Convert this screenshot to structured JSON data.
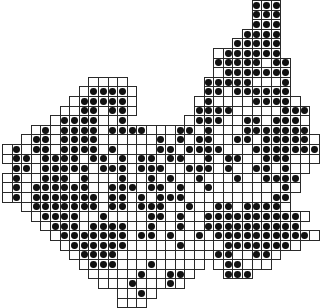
{
  "map": {
    "type": "grid distribution map",
    "cell_size_px": 9.6,
    "origin": [
      2,
      0
    ],
    "colors": {
      "grid": "#2a2a2a",
      "dot": "#111111",
      "background": "#ffffff"
    },
    "legend": {
      "o": "surveyed square, species absent",
      "#": "surveyed square, species recorded",
      ".": "outside region"
    },
    "rows": [
      "..........................###....",
      "..........................###....",
      "..........................###....",
      ".........................####....",
      "........................#####....",
      "......................o######....",
      "......................#####o##...",
      "......................o#######...",
      ".........oooo........#####ooo#...",
      "........o####o.......##o######...",
      ".......o#####o......o#oooo####o..",
      "......oo##o##o......####ooooo###.",
      ".....o####oo#......o###oo##o###o.",
      "...o#o####o####ooo##o#ooo#######.",
      "..o##o####oooooo#o#o##oo##o#####o",
      "o#o##o####o#oooo##o####ooo#######",
      "o##o####o##o#o##o##oo#o##oo###ooo",
      ".##o#####o###o###oo###o#oo##o#oo.",
      "o#oo###o#ooo#oo#o#oo#ooo#oo####..",
      "o#o######oo###o##o#oo#ooooooo#o..",
      "o#o#######o##o#o###ooooooooo##...",
      "..o#######o##o###oo#oo##o####o...",
      "...o####oo#oooo##o#oo##########o.",
      "....o###o####oo#oo#oo##########..",
      ".....o#######o##o#oo#o##########o",
      "......o######ooooo#oooo#######o..",
      ".......o####oooooooooo##oo##o....",
      "........o###ooo#ooooo.o##ooo.....",
      ".........ooooo#oo##o...###.......",
      "..........ooo#ooo#o..............",
      "............oo#o.................",
      "............ooo.................."
    ]
  }
}
